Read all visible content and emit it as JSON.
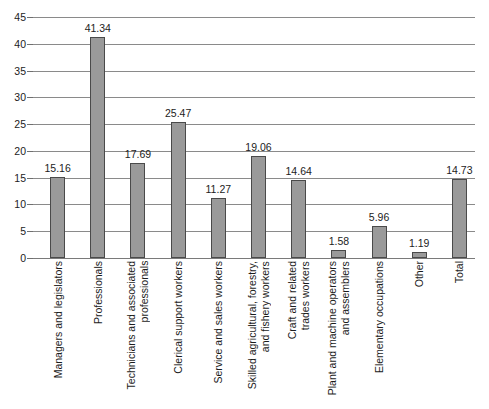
{
  "chart_data": {
    "type": "bar",
    "title": "",
    "subtitle": "",
    "xlabel": "",
    "ylabel": "",
    "ylim": [
      0,
      45
    ],
    "ytick_step": 5,
    "yticks": [
      "0",
      "5",
      "10",
      "15",
      "20",
      "25",
      "30",
      "35",
      "40",
      "45"
    ],
    "grid": true,
    "legend": false,
    "bar_color": "#9a9a9a",
    "bar_border_color": "#4a4a4a",
    "gridline_color": "#8a8a8a",
    "categories": [
      "Managers and legislators",
      "Professionals",
      "Technicians and associated\nprofessionals",
      "Clerical support workers",
      "Service and sales workers",
      "Skilled agricultural, forestry,\nand fishery workers",
      "Craft and related\ntrades workers",
      "Plant and machine operators\nand assemblers",
      "Elementary occupations",
      "Other",
      "Total"
    ],
    "values": [
      15.16,
      41.34,
      17.69,
      25.47,
      11.27,
      19.06,
      14.64,
      1.58,
      5.96,
      1.19,
      14.73
    ],
    "value_labels": [
      "15.16",
      "41.34",
      "17.69",
      "25.47",
      "11.27",
      "19.06",
      "14.64",
      "1.58",
      "5.96",
      "1.19",
      "14.73"
    ]
  }
}
